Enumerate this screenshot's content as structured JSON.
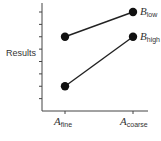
{
  "chart_data": {
    "type": "line",
    "title": "",
    "xlabel": "",
    "ylabel": "Results",
    "categories": [
      "A_fine",
      "A_coarse"
    ],
    "category_labels": [
      {
        "main": "A",
        "sub": "fine"
      },
      {
        "main": "A",
        "sub": "coarse"
      }
    ],
    "series": [
      {
        "name": "B_low",
        "label_main": "B",
        "label_sub": "low",
        "values": [
          6,
          8
        ]
      },
      {
        "name": "B_high",
        "label_main": "B",
        "label_sub": "high",
        "values": [
          2,
          6
        ]
      }
    ],
    "ylim": [
      0,
      8
    ],
    "y_ticks": 8,
    "y_tick_labels": [],
    "grid": false,
    "legend": "direct labels at right end of lines",
    "colors": {
      "line": "#222222",
      "marker": "#111111",
      "axis": "#444444"
    }
  }
}
